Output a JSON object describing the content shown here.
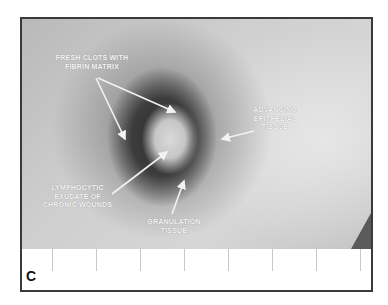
{
  "figure": {
    "panel_letter": "C",
    "labels": [
      {
        "id": "fresh-clots",
        "lines": [
          "FRESH CLOTS WITH",
          "FIBRIN MATRIX"
        ]
      },
      {
        "id": "advancing-epithelial",
        "lines": [
          "ADVANCING",
          "EPITHELIAL",
          "TISSUE"
        ]
      },
      {
        "id": "lymphocytic-exudate",
        "lines": [
          "LYMPHOCYTIC",
          "EXUDATE OF",
          "CHRONIC WOUNDS"
        ]
      },
      {
        "id": "granulation",
        "lines": [
          "GRANULATION",
          "TISSUE"
        ]
      }
    ],
    "colors": {
      "frame": "#3a3a3a",
      "label_text": "#f5f5f5",
      "wound_dark": "#2e2e2e",
      "skin": "#cfcfcf"
    }
  }
}
